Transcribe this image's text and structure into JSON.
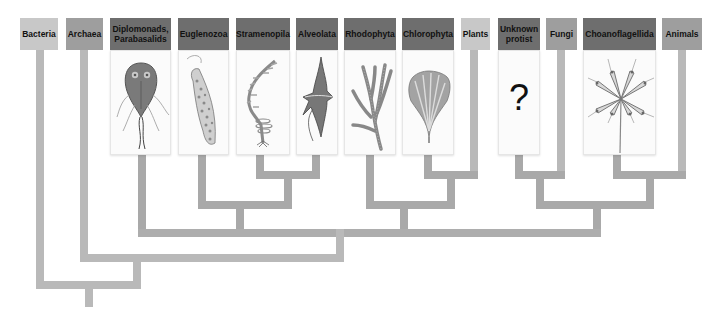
{
  "diagram": {
    "type": "phylogenetic-tree",
    "taxa": [
      {
        "id": "bacteria",
        "label": "Bacteria",
        "shade": "light",
        "illustration": null
      },
      {
        "id": "archaea",
        "label": "Archaea",
        "shade": "mid",
        "illustration": null
      },
      {
        "id": "diplomonads",
        "label": "Diplomonads, Parabasalids",
        "shade": "dark",
        "illustration": "giardia-like-flagellate"
      },
      {
        "id": "euglenozoa",
        "label": "Euglenozoa",
        "shade": "dark",
        "illustration": "euglena"
      },
      {
        "id": "stramenopila",
        "label": "Stramenopila",
        "shade": "dark",
        "illustration": "kelp"
      },
      {
        "id": "alveolata",
        "label": "Alveolata",
        "shade": "dark",
        "illustration": "dinoflagellate"
      },
      {
        "id": "rhodophyta",
        "label": "Rhodophyta",
        "shade": "dark",
        "illustration": "red-alga"
      },
      {
        "id": "chlorophyta",
        "label": "Chlorophyta",
        "shade": "dark",
        "illustration": "green-alga"
      },
      {
        "id": "plants",
        "label": "Plants",
        "shade": "light",
        "illustration": null
      },
      {
        "id": "unknown-protist",
        "label": "Unknown protist",
        "shade": "dark",
        "illustration": "question-mark",
        "glyph": "?"
      },
      {
        "id": "fungi",
        "label": "Fungi",
        "shade": "mid",
        "illustration": null
      },
      {
        "id": "choanoflagellida",
        "label": "Choanoflagellida",
        "shade": "dark",
        "illustration": "choanoflagellate-colony"
      },
      {
        "id": "animals",
        "label": "Animals",
        "shade": "mid",
        "illustration": null
      }
    ],
    "clades": [
      [
        "stramenopila",
        "alveolata"
      ],
      [
        "euglenozoa",
        [
          "stramenopila",
          "alveolata"
        ]
      ],
      [
        "chlorophyta",
        "plants"
      ],
      [
        "rhodophyta",
        [
          "chlorophyta",
          "plants"
        ]
      ],
      [
        "unknown-protist",
        "fungi"
      ],
      [
        "choanoflagellida",
        "animals"
      ],
      [
        [
          "unknown-protist",
          "fungi"
        ],
        [
          "choanoflagellida",
          "animals"
        ]
      ],
      [
        "diplomonads",
        "euglenozoa-group",
        "rhodophyta-group",
        "opisthokont-group"
      ],
      [
        "archaea",
        "eukaryotes"
      ],
      [
        "bacteria",
        "archaea-eukaryotes"
      ]
    ],
    "colors": {
      "branch": "#b9b9b9",
      "label_light": "#c8c8c8",
      "label_mid": "#9e9e9e",
      "label_dark": "#6e6e6e",
      "card": "#fbfbfb"
    }
  },
  "labels": {
    "bacteria": "Bacteria",
    "archaea": "Archaea",
    "diplomonads_1": "Diplomonads,",
    "diplomonads_2": "Parabasalids",
    "euglenozoa": "Euglenozoa",
    "stramenopila": "Stramenopila",
    "alveolata": "Alveolata",
    "rhodophyta": "Rhodophyta",
    "chlorophyta": "Chlorophyta",
    "plants": "Plants",
    "unknown_1": "Unknown",
    "unknown_2": "protist",
    "fungi": "Fungi",
    "choanoflagellida": "Choanoflagellida",
    "animals": "Animals",
    "question": "?"
  }
}
